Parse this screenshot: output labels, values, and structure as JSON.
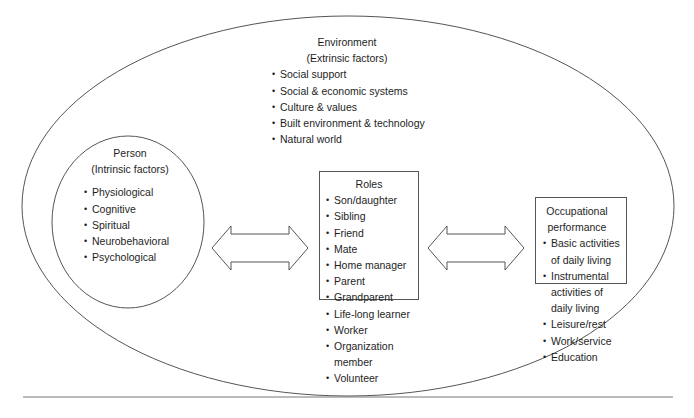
{
  "environment": {
    "title": "Environment",
    "subtitle": "(Extrinsic factors)",
    "items": [
      "Social support",
      "Social & economic systems",
      "Culture & values",
      "Built environment & technology",
      "Natural world"
    ]
  },
  "person": {
    "title": "Person",
    "subtitle": "(Intrinsic factors)",
    "items": [
      "Physiological",
      "Cognitive",
      "Spiritual",
      "Neurobehavioral",
      "Psychological"
    ]
  },
  "roles": {
    "title": "Roles",
    "items": [
      "Son/daughter",
      "Sibling",
      "Friend",
      "Mate",
      "Home manager",
      "Parent",
      "Grandparent",
      "Life-long learner",
      "Worker",
      "Organization member",
      "Volunteer"
    ]
  },
  "occupational_performance": {
    "title": "Occupational performance",
    "items": [
      "Basic activities of daily living",
      "Instrumental activities of daily living",
      "Leisure/rest",
      "Work/service",
      "Education"
    ]
  },
  "arrows": [
    {
      "name": "person-roles",
      "direction": "bidirectional"
    },
    {
      "name": "roles-occupational-performance",
      "direction": "bidirectional"
    }
  ],
  "colors": {
    "stroke": "#555555",
    "text": "#1e1e1e",
    "background": "#ffffff"
  }
}
